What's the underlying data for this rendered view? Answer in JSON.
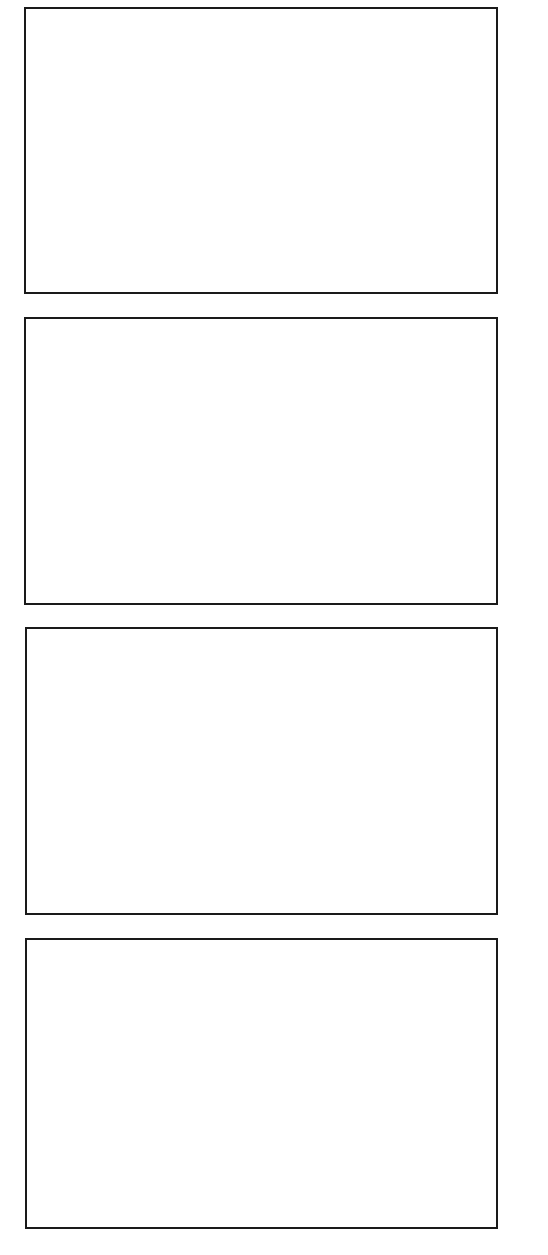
{
  "page": {
    "background_color": "#ffffff",
    "border_color": "#1a1a1a"
  },
  "panels": [
    {
      "index": 1,
      "content": ""
    },
    {
      "index": 2,
      "content": ""
    },
    {
      "index": 3,
      "content": ""
    },
    {
      "index": 4,
      "content": ""
    }
  ]
}
